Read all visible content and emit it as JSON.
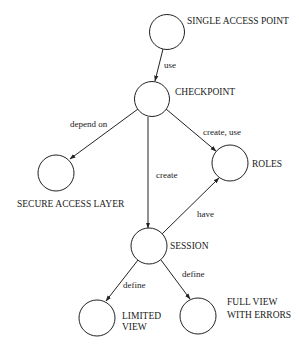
{
  "diagram": {
    "type": "directed-graph",
    "nodes": {
      "single_access_point": {
        "label": "SINGLE ACCESS POINT"
      },
      "checkpoint": {
        "label": "CHECKPOINT"
      },
      "secure_access_layer": {
        "label": "SECURE ACCESS LAYER"
      },
      "roles": {
        "label": "ROLES"
      },
      "session": {
        "label": "SESSION"
      },
      "limited_view": {
        "label_line1": "LIMITED",
        "label_line2": "VIEW"
      },
      "full_view_with_errors": {
        "label_line1": "FULL VIEW",
        "label_line2": "WITH ERRORS"
      }
    },
    "edges": {
      "sap_to_checkpoint": {
        "from": "SINGLE ACCESS POINT",
        "to": "CHECKPOINT",
        "label": "use"
      },
      "checkpoint_to_sal": {
        "from": "CHECKPOINT",
        "to": "SECURE ACCESS LAYER",
        "label": "depend on"
      },
      "checkpoint_to_roles": {
        "from": "CHECKPOINT",
        "to": "ROLES",
        "label": "create, use"
      },
      "checkpoint_to_session": {
        "from": "CHECKPOINT",
        "to": "SESSION",
        "label": "create"
      },
      "session_to_roles": {
        "from": "SESSION",
        "to": "ROLES",
        "label": "have"
      },
      "session_to_limited": {
        "from": "SESSION",
        "to": "LIMITED VIEW",
        "label": "define"
      },
      "session_to_full": {
        "from": "SESSION",
        "to": "FULL VIEW WITH ERRORS",
        "label": "define"
      }
    },
    "colors": {
      "stroke": "#222222",
      "background": "#ffffff",
      "text": "#1a1a1a"
    }
  }
}
